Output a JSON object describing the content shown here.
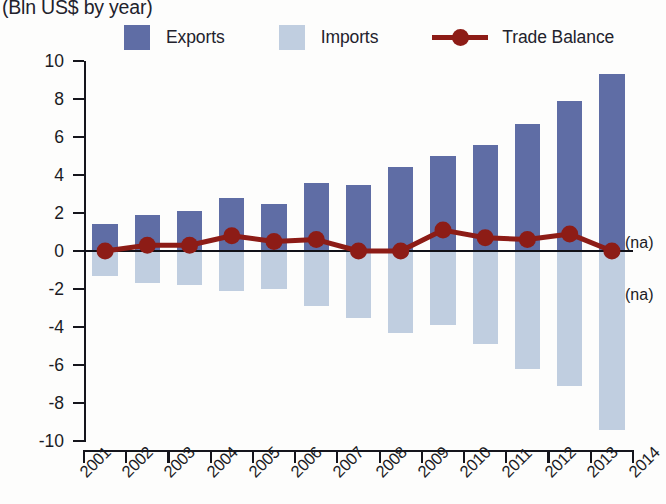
{
  "header": {
    "subtitle": "(Bln US$ by year)"
  },
  "legend": {
    "position": "top",
    "items": [
      {
        "label": "Exports",
        "marker": "square-swatch",
        "color": "#5f6da5"
      },
      {
        "label": "Imports",
        "marker": "square-swatch",
        "color": "#c0cee0"
      },
      {
        "label": "Trade Balance",
        "marker": "line-with-dot",
        "color": "#8d1c16"
      }
    ]
  },
  "annotations": {
    "na_above_axis": "(na)",
    "na_below_axis": "(na)"
  },
  "chart_data": {
    "type": "bar",
    "title": "",
    "subtitle": "(Bln US$ by year)",
    "xlabel": "",
    "ylabel": "",
    "ylim": [
      -10,
      10
    ],
    "ytick_labels": [
      "10",
      "8",
      "6",
      "4",
      "2",
      "0",
      "-2",
      "-4",
      "-6",
      "-8",
      "-10"
    ],
    "ytick_values": [
      10,
      8,
      6,
      4,
      2,
      0,
      -2,
      -4,
      -6,
      -8,
      -10
    ],
    "grid": false,
    "legend_position": "top",
    "axis_years": [
      "2001",
      "2002",
      "2003",
      "2004",
      "2005",
      "2006",
      "2007",
      "2008",
      "2009",
      "2010",
      "2011",
      "2012",
      "2013",
      "2014"
    ],
    "categories": [
      "2001",
      "2002",
      "2003",
      "2004",
      "2005",
      "2006",
      "2007",
      "2008",
      "2009",
      "2010",
      "2011",
      "2012",
      "2013"
    ],
    "series": [
      {
        "name": "Exports",
        "type": "bar",
        "color": "#5f6da5",
        "values": [
          1.4,
          1.9,
          2.1,
          2.8,
          2.5,
          3.6,
          3.5,
          4.4,
          5.0,
          5.6,
          6.7,
          7.9,
          9.3
        ]
      },
      {
        "name": "Imports",
        "type": "bar",
        "color": "#c0cee0",
        "values": [
          -1.3,
          -1.7,
          -1.8,
          -2.1,
          -2.0,
          -2.9,
          -3.5,
          -4.3,
          -3.9,
          -4.9,
          -6.2,
          -7.1,
          -9.4
        ]
      },
      {
        "name": "Trade Balance",
        "type": "line",
        "color": "#8d1c16",
        "values": [
          0.0,
          0.3,
          0.3,
          0.8,
          0.5,
          0.6,
          0.0,
          0.0,
          1.1,
          0.7,
          0.6,
          0.9,
          0.0
        ]
      }
    ]
  }
}
